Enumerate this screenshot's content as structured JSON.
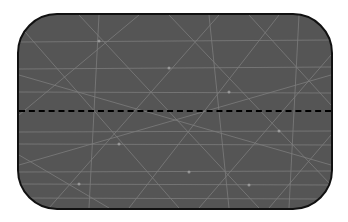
{
  "figure": {
    "shape": "rounded-rectangle",
    "fill_color": "#555555",
    "border_color": "#111111",
    "texture_line_color": "#8a8a8a",
    "divider": {
      "style": "dashed",
      "color": "#000000",
      "orientation": "horizontal"
    }
  }
}
